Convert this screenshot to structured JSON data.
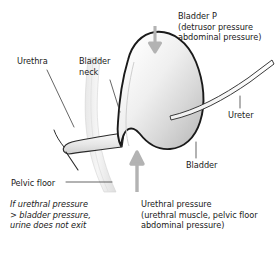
{
  "figure": {
    "type": "anatomical-diagram",
    "background_color": "#ffffff",
    "text_color": "#1a1a1a",
    "outline_color": "#1a1a1a",
    "organ_fill_light": "#f7f7f7",
    "organ_fill_dark": "#c6c6c6",
    "arrow_color": "#b3b3b3",
    "leader_color": "#555555"
  },
  "labels": {
    "bladder_p": {
      "line1": "Bladder P",
      "line2": "(detrusor pressure",
      "line3": "abdominal pressure)"
    },
    "urethra": "Urethra",
    "bladder_neck": {
      "line1": "Bladder",
      "line2": "neck"
    },
    "ureter": "Ureter",
    "bladder": "Bladder",
    "pelvic_floor": "Pelvic floor",
    "note": {
      "line1": "If urethral pressure",
      "line2": "> bladder pressure,",
      "line3": "urine does not exit"
    },
    "urethral_pressure": {
      "line1": "Urethral pressure",
      "line2": "(urethral muscle, pelvic floor",
      "line3": "abdominal pressure)"
    }
  },
  "arrows": [
    {
      "name": "bladder-pressure-arrow",
      "direction": "down",
      "color": "#b3b3b3"
    },
    {
      "name": "urethral-pressure-arrow",
      "direction": "up",
      "color": "#b3b3b3"
    }
  ],
  "structures": [
    {
      "name": "bladder",
      "shape": "teardrop"
    },
    {
      "name": "ureter",
      "shape": "tube"
    },
    {
      "name": "urethra",
      "shape": "tube"
    },
    {
      "name": "bladder-neck",
      "shape": "junction"
    },
    {
      "name": "pelvic-floor",
      "shape": "band"
    }
  ]
}
